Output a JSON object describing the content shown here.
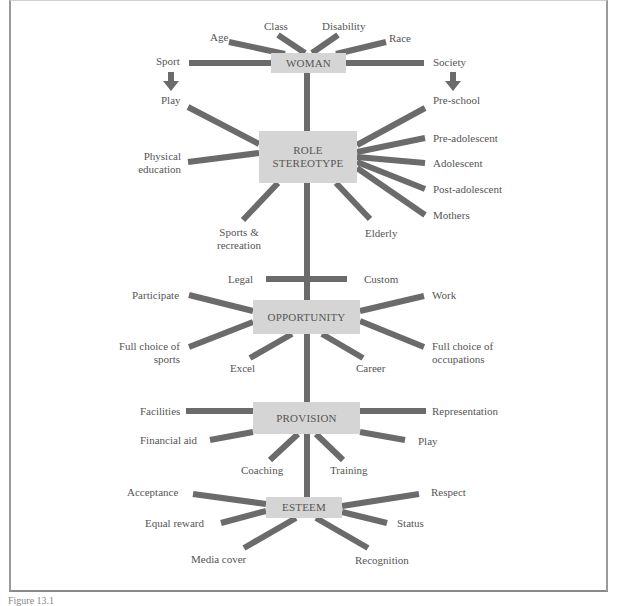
{
  "diagram": {
    "type": "concept-map",
    "colors": {
      "line": "#6b6b6b",
      "node_fill": "#d5d5d5",
      "text": "#555555",
      "frame": "#9a9a9a"
    },
    "nodes": {
      "woman": "WOMAN",
      "role_stereotype": "ROLE STEREOTYPE",
      "role_line1": "ROLE",
      "role_line2": "STEREOTYPE",
      "opportunity": "OPPORTUNITY",
      "provision": "PROVISION",
      "esteem": "ESTEEM"
    },
    "woman_branches": {
      "age": "Age",
      "class": "Class",
      "disability": "Disability",
      "race": "Race",
      "sport": "Sport",
      "society": "Society",
      "play": "Play",
      "pre_school": "Pre-school"
    },
    "role_branches": {
      "physical_1": "Physical",
      "physical_2": "education",
      "sports_1": "Sports &",
      "sports_2": "recreation",
      "elderly": "Elderly",
      "pre_adolescent": "Pre-adolescent",
      "adolescent": "Adolescent",
      "post_adolescent": "Post-adolescent",
      "mothers": "Mothers"
    },
    "opportunity_branches": {
      "legal": "Legal",
      "custom": "Custom",
      "participate": "Participate",
      "work": "Work",
      "full_sports_1": "Full choice of",
      "full_sports_2": "sports",
      "full_occ_1": "Full choice of",
      "full_occ_2": "occupations",
      "excel": "Excel",
      "career": "Career"
    },
    "provision_branches": {
      "facilities": "Facilities",
      "representation": "Representation",
      "financial_aid": "Financial aid",
      "play": "Play",
      "coaching": "Coaching",
      "training": "Training"
    },
    "esteem_branches": {
      "acceptance": "Acceptance",
      "respect": "Respect",
      "equal_reward": "Equal reward",
      "status": "Status",
      "media_cover": "Media cover",
      "recognition": "Recognition"
    },
    "caption": "Figure 13.1"
  }
}
